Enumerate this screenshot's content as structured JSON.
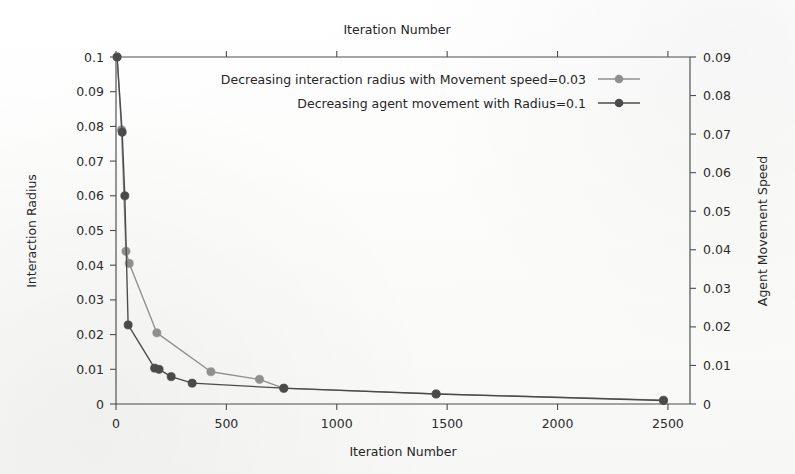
{
  "figure": {
    "top_title": "Iteration Number",
    "background_color": "#fdfdfc"
  },
  "axes": {
    "x": {
      "label": "Iteration Number",
      "ticks": [
        "0",
        "500",
        "1000",
        "1500",
        "2000",
        "2500"
      ],
      "min": 0,
      "max": 2600
    },
    "y_left": {
      "label": "Interaction Radius",
      "ticks": [
        "0",
        "0.01",
        "0.02",
        "0.03",
        "0.04",
        "0.05",
        "0.06",
        "0.07",
        "0.08",
        "0.09",
        "0.1"
      ],
      "min": 0,
      "max": 0.1
    },
    "y_right": {
      "label": "Agent Movement Speed",
      "ticks": [
        "0",
        "0.01",
        "0.02",
        "0.03",
        "0.04",
        "0.05",
        "0.06",
        "0.07",
        "0.08",
        "0.09"
      ],
      "min": 0,
      "max": 0.09
    }
  },
  "legend": {
    "entries": [
      {
        "label": "Decreasing interaction radius with Movement speed=0.03",
        "color": "#8f8f8f",
        "marker": "circle-marker"
      },
      {
        "label": "Decreasing agent movement with Radius=0.1",
        "color": "#4a4a4a",
        "marker": "circle-marker"
      }
    ]
  },
  "chart_data": {
    "type": "line",
    "title": "Iteration Number",
    "xlabel": "Iteration Number",
    "ylabel": "Interaction Radius",
    "ylabel_right": "Agent Movement Speed",
    "xlim": [
      0,
      2600
    ],
    "ylim": [
      0,
      0.1
    ],
    "ylim_right": [
      0,
      0.09
    ],
    "grid": false,
    "legend_position": "upper-center",
    "series": [
      {
        "name": "Decreasing interaction radius with Movement speed=0.03",
        "axis": "left",
        "color": "#8f8f8f",
        "points": [
          {
            "x": 5,
            "y": 0.1
          },
          {
            "x": 25,
            "y": 0.079
          },
          {
            "x": 45,
            "y": 0.044
          },
          {
            "x": 60,
            "y": 0.0405
          },
          {
            "x": 185,
            "y": 0.0205
          },
          {
            "x": 430,
            "y": 0.0093
          },
          {
            "x": 650,
            "y": 0.0071
          },
          {
            "x": 760,
            "y": 0.0045
          },
          {
            "x": 1450,
            "y": 0.0029
          },
          {
            "x": 2480,
            "y": 0.0011
          }
        ]
      },
      {
        "name": "Decreasing agent movement with Radius=0.1",
        "axis": "right",
        "color": "#4a4a4a",
        "points": [
          {
            "x": 5,
            "y": 0.09
          },
          {
            "x": 28,
            "y": 0.0705
          },
          {
            "x": 40,
            "y": 0.054
          },
          {
            "x": 55,
            "y": 0.0205
          },
          {
            "x": 175,
            "y": 0.0093
          },
          {
            "x": 195,
            "y": 0.009
          },
          {
            "x": 250,
            "y": 0.0071
          },
          {
            "x": 345,
            "y": 0.0054
          },
          {
            "x": 760,
            "y": 0.0041
          },
          {
            "x": 1450,
            "y": 0.0026
          },
          {
            "x": 2480,
            "y": 0.0009
          }
        ]
      }
    ]
  }
}
